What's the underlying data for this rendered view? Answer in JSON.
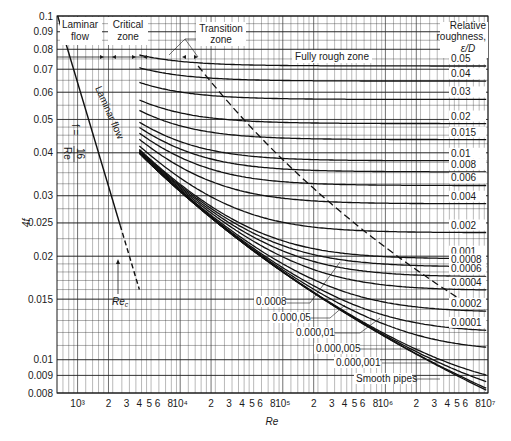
{
  "chart_data": {
    "type": "line",
    "xlabel": "Re",
    "ylabel": "4f",
    "xscale": "log",
    "yscale": "log",
    "xlim": [
      630,
      10000000
    ],
    "ylim": [
      0.008,
      0.1
    ],
    "grid": true,
    "x_ticks": [
      {
        "v": 1000,
        "label": "10³"
      },
      {
        "v": 2000,
        "label": "2"
      },
      {
        "v": 3000,
        "label": "3"
      },
      {
        "v": 4000,
        "label": "4"
      },
      {
        "v": 5000,
        "label": "5"
      },
      {
        "v": 6000,
        "label": "6"
      },
      {
        "v": 8000,
        "label": "8"
      },
      {
        "v": 10000,
        "label": "10⁴"
      },
      {
        "v": 20000,
        "label": "2"
      },
      {
        "v": 30000,
        "label": "3"
      },
      {
        "v": 40000,
        "label": "4"
      },
      {
        "v": 50000,
        "label": "5"
      },
      {
        "v": 60000,
        "label": "6"
      },
      {
        "v": 80000,
        "label": "8"
      },
      {
        "v": 100000,
        "label": "10⁵"
      },
      {
        "v": 200000,
        "label": "2"
      },
      {
        "v": 300000,
        "label": "3"
      },
      {
        "v": 400000,
        "label": "4"
      },
      {
        "v": 500000,
        "label": "5"
      },
      {
        "v": 600000,
        "label": "6"
      },
      {
        "v": 800000,
        "label": "8"
      },
      {
        "v": 1000000,
        "label": "10⁶"
      },
      {
        "v": 2000000,
        "label": "2"
      },
      {
        "v": 3000000,
        "label": "3"
      },
      {
        "v": 4000000,
        "label": "4"
      },
      {
        "v": 5000000,
        "label": "5"
      },
      {
        "v": 6000000,
        "label": "6"
      },
      {
        "v": 8000000,
        "label": "8"
      },
      {
        "v": 10000000,
        "label": "10⁷"
      }
    ],
    "y_ticks": [
      {
        "v": 0.1,
        "label": "0.1"
      },
      {
        "v": 0.09,
        "label": "0.09"
      },
      {
        "v": 0.08,
        "label": "0.08"
      },
      {
        "v": 0.07,
        "label": "0.07"
      },
      {
        "v": 0.06,
        "label": "0.06"
      },
      {
        "v": 0.05,
        "label": "0.05"
      },
      {
        "v": 0.04,
        "label": "0.04"
      },
      {
        "v": 0.03,
        "label": "0.03"
      },
      {
        "v": 0.025,
        "label": "0.025"
      },
      {
        "v": 0.02,
        "label": "0.02"
      },
      {
        "v": 0.015,
        "label": "0.015"
      },
      {
        "v": 0.01,
        "label": "0.01"
      },
      {
        "v": 0.009,
        "label": "0.009"
      },
      {
        "v": 0.008,
        "label": "0.008"
      }
    ],
    "laminar": {
      "equation": "f = 16/Re",
      "label": "Laminar flow",
      "re_start": 640,
      "re_solid_end": 2600,
      "re_dashed_end": 4000
    },
    "critical_re_label": "Re_c",
    "roughness_header": [
      "Relative",
      "roughness,",
      "ε/D"
    ],
    "roughness_series": [
      {
        "name": "0.05",
        "eps": 0.05
      },
      {
        "name": "0.04",
        "eps": 0.04
      },
      {
        "name": "0.03",
        "eps": 0.03
      },
      {
        "name": "0.02",
        "eps": 0.02
      },
      {
        "name": "0.015",
        "eps": 0.015
      },
      {
        "name": "0.01",
        "eps": 0.01
      },
      {
        "name": "0.008",
        "eps": 0.008
      },
      {
        "name": "0.006",
        "eps": 0.006
      },
      {
        "name": "0.004",
        "eps": 0.004
      },
      {
        "name": "0.002",
        "eps": 0.002
      },
      {
        "name": "0.001",
        "eps": 0.001
      },
      {
        "name": "0.0008",
        "eps": 0.0008
      },
      {
        "name": "0.0006",
        "eps": 0.0006
      },
      {
        "name": "0.0004",
        "eps": 0.0004
      },
      {
        "name": "0.0002",
        "eps": 0.0002
      },
      {
        "name": "0.0001",
        "eps": 0.0001
      },
      {
        "name": "0.000,05",
        "eps": 5e-05
      },
      {
        "name": "0.000,01",
        "eps": 1e-05
      },
      {
        "name": "0.000,005",
        "eps": 5e-06
      },
      {
        "name": "0.000,001",
        "eps": 1e-06
      },
      {
        "name": "Smooth pipes",
        "eps": 0
      }
    ],
    "turbulent_re_start": 4000,
    "annotations": [
      {
        "text": "Laminar flow",
        "where": "top-left zone label"
      },
      {
        "text": "Critical zone",
        "where": "top zone label"
      },
      {
        "text": "Transition zone",
        "where": "top zone label"
      },
      {
        "text": "Fully rough zone",
        "where": "top-right zone label"
      },
      {
        "text": "f = 16/Re",
        "where": "along laminar line"
      },
      {
        "text": "Re_c",
        "where": "arrow at critical Reynolds number ~2100"
      }
    ]
  },
  "labels": {
    "zone_laminar_1": "Laminar",
    "zone_laminar_2": "flow",
    "zone_critical_1": "Critical",
    "zone_critical_2": "zone",
    "zone_transition_1": "Transition",
    "zone_transition_2": "zone",
    "zone_rough": "Fully rough zone",
    "rough_h1": "Relative",
    "rough_h2": "roughness,",
    "rough_h3": "ε/D",
    "laminar_line": "Laminar flow",
    "eq_f": "f =",
    "eq_num": "16",
    "eq_den": "Re",
    "rec": "Re",
    "rec_sub": "c",
    "xlabel": "Re",
    "ylabel": "4f",
    "smooth": "Smooth pipes",
    "l_0008": "0.0008",
    "l_00005": "0.000,05",
    "l_00001": "0.000,01",
    "l_000005": "0.000,005",
    "l_000001": "0.000,001"
  }
}
